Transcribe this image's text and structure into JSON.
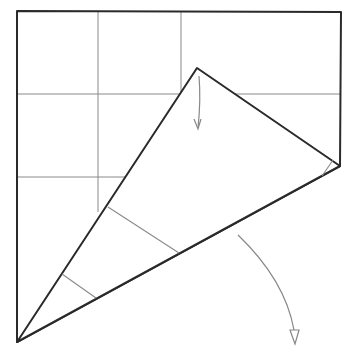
{
  "diagram": {
    "type": "origami-fold-step",
    "colors": {
      "edge": "#2a2a2a",
      "grid": "#8a8a8a",
      "arrow": "#888888",
      "background": "#ffffff"
    },
    "paper_outline": "17,11 341,12 340,166 17,342",
    "folded_flap": "17,342 197,68 340,166",
    "grid_lines": [
      {
        "x1": 98,
        "y1": 11,
        "x2": 98,
        "y2": 212
      },
      {
        "x1": 181,
        "y1": 12,
        "x2": 181,
        "y2": 93
      },
      {
        "x1": 17,
        "y1": 94,
        "x2": 181,
        "y2": 94
      },
      {
        "x1": 235,
        "y1": 94,
        "x2": 340,
        "y2": 94
      },
      {
        "x1": 17,
        "y1": 177,
        "x2": 126,
        "y2": 177
      }
    ],
    "creases": [
      {
        "x1": 108,
        "y1": 207,
        "x2": 179,
        "y2": 253
      },
      {
        "x1": 62,
        "y1": 274,
        "x2": 96,
        "y2": 298
      },
      {
        "x1": 333,
        "y1": 160,
        "x2": 322,
        "y2": 176
      }
    ],
    "dashed_line": {
      "x1": 181,
      "y1": 94,
      "x2": 235,
      "y2": 94
    },
    "arrows": [
      {
        "name": "fold-down-arrow",
        "path": "M199,76 Q201,100 198,128",
        "head": "M194,119 L198,129 L201,119"
      },
      {
        "name": "turn-over-arrow",
        "path": "M238,235 Q285,280 294,330",
        "head": "290,330 299,330 295,344"
      }
    ]
  }
}
